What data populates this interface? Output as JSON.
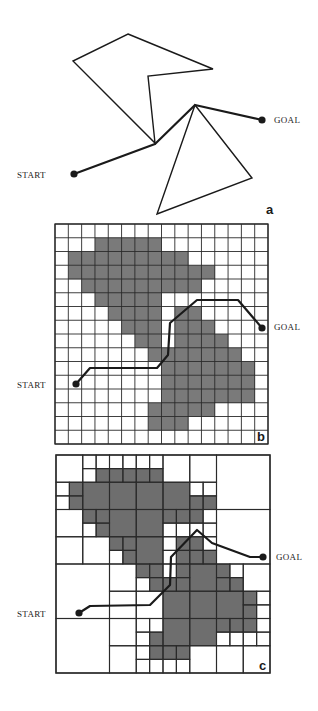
{
  "colors": {
    "ink": "#1a1a1a",
    "grid": "#2a2a2a",
    "obstacle": "#7a7a7a",
    "obstacle_dark": "#6e6e6e",
    "background": "#ffffff"
  },
  "labels": {
    "start": "START",
    "goal": "GOAL"
  },
  "panels": [
    {
      "id": "a",
      "letter": "a",
      "type": "visibility-graph",
      "letter_pos": [
        266,
        214
      ],
      "polygons": [
        [
          [
            128,
            34
          ],
          [
            213,
            69
          ],
          [
            148,
            76
          ],
          [
            155,
            143
          ],
          [
            73,
            61
          ]
        ],
        [
          [
            195,
            105
          ],
          [
            252,
            178
          ],
          [
            157,
            214
          ]
        ]
      ],
      "path": [
        [
          74,
          174
        ],
        [
          155,
          144
        ],
        [
          195,
          105
        ],
        [
          262,
          120
        ]
      ],
      "start": {
        "point": [
          74,
          174
        ],
        "label_pos": [
          17,
          178
        ]
      },
      "goal": {
        "point": [
          262,
          120
        ],
        "label_pos": [
          274,
          123
        ]
      }
    },
    {
      "id": "b",
      "letter": "b",
      "type": "uniform-grid",
      "letter_pos": [
        257,
        441
      ],
      "grid": {
        "x": 55,
        "y": 224,
        "w": 213,
        "h": 220,
        "cols": 16,
        "rows": 16
      },
      "path": [
        [
          76,
          384
        ],
        [
          90,
          368
        ],
        [
          157,
          368
        ],
        [
          168,
          355
        ],
        [
          170,
          323
        ],
        [
          197,
          300
        ],
        [
          238,
          300
        ],
        [
          262,
          328
        ]
      ],
      "start": {
        "point": [
          76,
          384
        ],
        "label_pos": [
          17,
          388
        ]
      },
      "goal": {
        "point": [
          262,
          328
        ],
        "label_pos": [
          274,
          330
        ]
      }
    },
    {
      "id": "c",
      "letter": "c",
      "type": "quadtree",
      "letter_pos": [
        259,
        670
      ],
      "grid": {
        "x": 56,
        "y": 455,
        "w": 214,
        "h": 218,
        "cols": 16,
        "rows": 16
      },
      "path": [
        [
          79,
          613
        ],
        [
          90,
          606
        ],
        [
          150,
          605
        ],
        [
          170,
          585
        ],
        [
          171,
          557
        ],
        [
          197,
          530
        ],
        [
          212,
          543
        ],
        [
          250,
          557
        ],
        [
          263,
          557
        ]
      ],
      "start": {
        "point": [
          79,
          613
        ],
        "label_pos": [
          17,
          617
        ]
      },
      "goal": {
        "point": [
          263,
          557
        ],
        "label_pos": [
          276,
          560
        ]
      }
    }
  ],
  "occupancy": [
    "................",
    "...#####........",
    ".#########......",
    ".###########....",
    "..#########.....",
    "...#####........",
    "....####.##.....",
    ".....###.###....",
    "......##.####...",
    ".......#######..",
    "........#######.",
    "........#######.",
    "........#######.",
    ".......#####....",
    ".......###......",
    "................"
  ]
}
